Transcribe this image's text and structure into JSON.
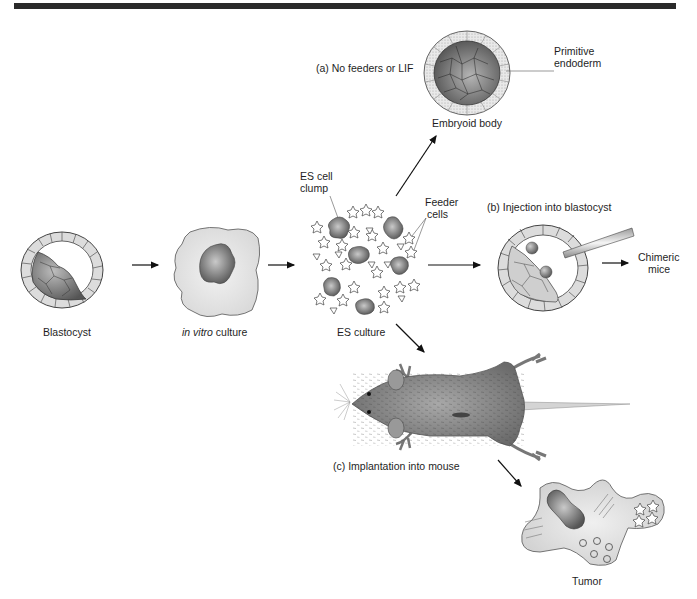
{
  "figure": {
    "top_rule": true,
    "labels": {
      "blastocyst": "Blastocyst",
      "in_vitro_italic": "in vitro",
      "in_vitro_rest": " culture",
      "es_culture": "ES culture",
      "es_cell_clump_line1": "ES cell",
      "es_cell_clump_line2": "clump",
      "feeder_cells_line1": "Feeder",
      "feeder_cells_line2": "cells",
      "path_a": "(a)  No feeders or LIF",
      "embryoid_body": "Embryoid body",
      "primitive_endoderm_line1": "Primitive",
      "primitive_endoderm_line2": "endoderm",
      "path_b": "(b)  Injection into blastocyst",
      "chimeric_mice_line1": "Chimeric",
      "chimeric_mice_line2": "mice",
      "path_c": "(c)  Implantation into mouse",
      "tumor": "Tumor"
    },
    "colors": {
      "rule": "#2a2a2a",
      "cell_fill": "#e6e6e6",
      "icm_dark": "#6e6e6e",
      "culture_fill": "#e8e8e8",
      "mouse_fur": "#8a8a8a",
      "text": "#1e1e1e"
    }
  }
}
